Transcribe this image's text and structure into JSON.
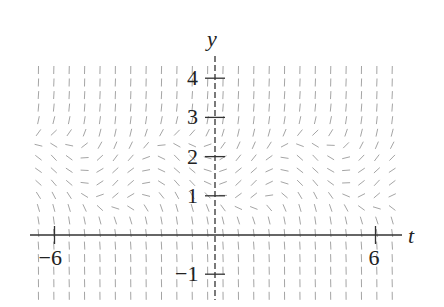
{
  "chart_data": {
    "type": "slope_field",
    "title": "",
    "xlabel": "t",
    "ylabel": "y",
    "xlim": [
      -7,
      7
    ],
    "ylim": [
      -1.5,
      4.5
    ],
    "x_ticks": [
      {
        "value": -6,
        "label": "−6"
      },
      {
        "value": 6,
        "label": "6"
      }
    ],
    "y_ticks": [
      {
        "value": 4,
        "label": "4"
      },
      {
        "value": 3,
        "label": "3"
      },
      {
        "value": 2,
        "label": "2"
      },
      {
        "value": 1,
        "label": "1"
      },
      {
        "value": -1,
        "label": "−1"
      }
    ],
    "grid": false,
    "axes_color": "#333333",
    "segment_color": "#9a9a9a",
    "field_grid": {
      "t_start": -6.6,
      "t_step": 0.575,
      "t_count": 24,
      "y_start": -1.55,
      "y_step": 0.32,
      "y_count": 19
    }
  },
  "pixel_map": {
    "origin_x": 215,
    "origin_y": 235,
    "px_per_t": 26.75,
    "px_per_y": 39.2
  },
  "labels": {
    "x_axis": "t",
    "y_axis": "y"
  }
}
